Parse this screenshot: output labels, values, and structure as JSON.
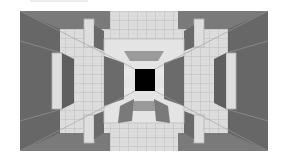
{
  "image": {
    "description": "Grayscale 3D perspective tunnel of cubes with black square at center",
    "colors": {
      "background": "#ffffff",
      "outer_wall": "#6e6e6e",
      "mid_wall": "#8a8a8a",
      "light_tile": "#d9d9d9",
      "lighter_tile": "#e6e6e6",
      "grid_line": "#b5b5b5",
      "side_dark": "#5e5e5e",
      "center_hole": "#000000"
    },
    "scene": {
      "x": 20,
      "y": 11,
      "width": 248,
      "height": 140
    },
    "center_square": {
      "x": 116,
      "y": 58,
      "width": 22,
      "height": 22
    }
  }
}
